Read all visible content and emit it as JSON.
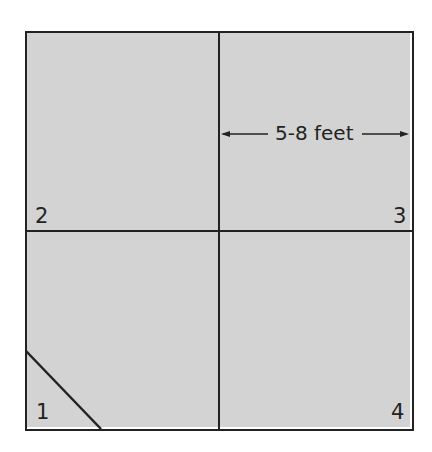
{
  "diagram": {
    "type": "quadrant-layout",
    "colors": {
      "fill": "#d3d3d3",
      "line": "#222222",
      "background": "#ffffff"
    },
    "quadrants": [
      {
        "label": "2",
        "position": "top-left"
      },
      {
        "label": "3",
        "position": "top-right"
      },
      {
        "label": "1",
        "position": "bottom-left",
        "has_diagonal_corner": true
      },
      {
        "label": "4",
        "position": "bottom-right"
      }
    ],
    "dimension": {
      "label": "5-8 feet",
      "spans": "width of quadrant 3"
    }
  }
}
